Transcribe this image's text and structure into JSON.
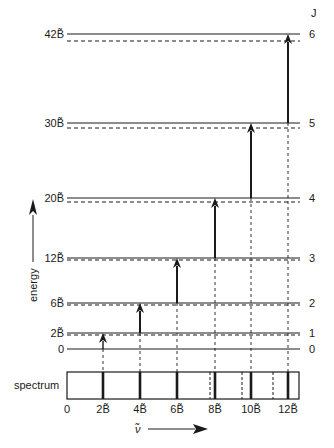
{
  "diagram": {
    "j_header": "J",
    "energy_axis_label": "energy",
    "spectrum_label": "spectrum",
    "wavenumber_axis_label": "ν̃",
    "levels": [
      {
        "J": "0",
        "energy_label": "0",
        "solid_y": 349,
        "dashed_y": 349
      },
      {
        "J": "1",
        "energy_label": "2B̃",
        "solid_y": 333,
        "dashed_y": 335
      },
      {
        "J": "2",
        "energy_label": "6B̃",
        "solid_y": 303,
        "dashed_y": 305
      },
      {
        "J": "3",
        "energy_label": "12B̃",
        "solid_y": 258,
        "dashed_y": 260
      },
      {
        "J": "4",
        "energy_label": "20B̃",
        "solid_y": 198,
        "dashed_y": 202
      },
      {
        "J": "5",
        "energy_label": "30B̃",
        "solid_y": 123,
        "dashed_y": 128
      },
      {
        "J": "6",
        "energy_label": "42B̃",
        "solid_y": 34,
        "dashed_y": 41
      }
    ],
    "transitions": [
      {
        "from_J": 0,
        "to_J": 1,
        "x": 103,
        "dashed_x": 103,
        "wavenumber": "2B̃"
      },
      {
        "from_J": 1,
        "to_J": 2,
        "x": 140,
        "dashed_x": 140,
        "wavenumber": "4B̃"
      },
      {
        "from_J": 2,
        "to_J": 3,
        "x": 177,
        "dashed_x": 177,
        "wavenumber": "6B̃"
      },
      {
        "from_J": 3,
        "to_J": 4,
        "x": 215,
        "dashed_x": 210,
        "wavenumber": "8B̃"
      },
      {
        "from_J": 4,
        "to_J": 5,
        "x": 251,
        "dashed_x": 242,
        "wavenumber": "10B̃"
      },
      {
        "from_J": 5,
        "to_J": 6,
        "x": 288,
        "dashed_x": 273,
        "wavenumber": "12B̃"
      }
    ],
    "spectrum_ticks": [
      "0",
      "2B̃",
      "4B̃",
      "6B̃",
      "8B̃",
      "10B̃",
      "12B̃"
    ],
    "colors": {
      "ink": "#1a1a1a",
      "background": "#ffffff"
    }
  }
}
